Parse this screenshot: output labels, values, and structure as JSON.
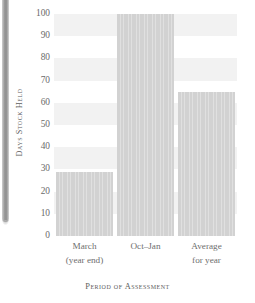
{
  "chart_data": {
    "type": "bar",
    "title": "",
    "xlabel": "Period of Assessment",
    "ylabel": "Days Stock Held",
    "categories": [
      "March (year end)",
      "Oct–Jan",
      "Average for year"
    ],
    "category_lines": [
      [
        "March",
        "(year end)"
      ],
      [
        "Oct–Jan",
        ""
      ],
      [
        "Average",
        "for year"
      ]
    ],
    "values": [
      29,
      100,
      65
    ],
    "ylim": [
      0,
      100
    ],
    "yticks": [
      0,
      10,
      20,
      30,
      40,
      50,
      60,
      70,
      80,
      90,
      100
    ],
    "ytick_labels": [
      "0",
      "10",
      "20",
      "30",
      "40",
      "50",
      "60",
      "70",
      "80",
      "90",
      "100"
    ],
    "grid": "horizontal-bands",
    "legend": "none",
    "bar_color": "#d2d2d2",
    "band_color": "#f2f2f2",
    "text_color": "#6a6a6a",
    "background": "#ffffff"
  },
  "page": {
    "spine_color": "#9a9a9a"
  }
}
